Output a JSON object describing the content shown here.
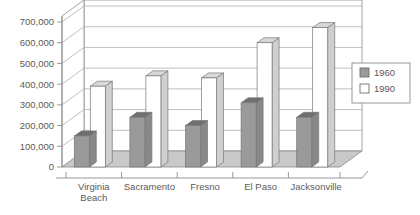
{
  "chart_data": {
    "type": "bar",
    "title": "",
    "subtitle": "",
    "xlabel": "",
    "ylabel": "",
    "categories": [
      "Virginia Beach",
      "Sacramento",
      "Fresno",
      "El Paso",
      "Jacksonville"
    ],
    "category_lines": [
      [
        "Virginia",
        "Beach"
      ],
      [
        "Sacramento"
      ],
      [
        "Fresno"
      ],
      [
        "El Paso"
      ],
      [
        "Jacksonville"
      ]
    ],
    "series": [
      {
        "name": "1960",
        "color": "#9a9a9a",
        "values": [
          150000,
          240000,
          200000,
          310000,
          240000
        ]
      },
      {
        "name": "1990",
        "color": "#ffffff",
        "values": [
          390000,
          440000,
          430000,
          600000,
          673000
        ]
      }
    ],
    "ylim": [
      0,
      700000
    ],
    "ytick_values": [
      0,
      100000,
      200000,
      300000,
      400000,
      500000,
      600000,
      700000
    ],
    "ytick_labels": [
      "0",
      "100,000",
      "200,000",
      "300,000",
      "400,000",
      "500,000",
      "600,000",
      "700,000"
    ],
    "grid": true,
    "grid_axis": "y",
    "legend": {
      "position": "right",
      "entries": [
        {
          "label": "1960",
          "swatch": "#9a9a9a",
          "swatch_name": "legend-swatch-1960"
        },
        {
          "label": "1990",
          "swatch": "#ffffff",
          "swatch_name": "legend-swatch-1990"
        }
      ]
    },
    "style": {
      "three_d": true,
      "wall_color": "#ffffff",
      "floor_color": "#c9c9c9",
      "axis_color": "#8c8c8c",
      "grid_color": "#b0b0b0",
      "bar_1960_top": "#6f6f6f",
      "bar_1960_side": "#888888",
      "bar_1990_top": "#d8d8d8",
      "bar_1990_side": "#cfcfcf",
      "text_color": "#5a5a5a"
    }
  }
}
